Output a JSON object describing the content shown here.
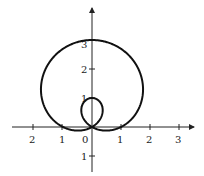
{
  "chart_data": {
    "type": "line",
    "title": "",
    "equation_hint": "polar limacon r = 1 + 2 sin(theta)",
    "xlabel": "",
    "ylabel": "",
    "xlim": [
      -2.8,
      3.4
    ],
    "ylim": [
      -1.6,
      4.2
    ],
    "grid": false,
    "x_ticks": [
      {
        "value": -2,
        "label": "2"
      },
      {
        "value": -1,
        "label": "1"
      },
      {
        "value": 0,
        "label": "0"
      },
      {
        "value": 1,
        "label": "1"
      },
      {
        "value": 2,
        "label": "2"
      },
      {
        "value": 3,
        "label": "3"
      }
    ],
    "y_ticks": [
      {
        "value": 1,
        "label": "1"
      },
      {
        "value": 2,
        "label": "2"
      },
      {
        "value": 3,
        "label": "3"
      },
      {
        "value": -1,
        "label": "1"
      }
    ],
    "series": [
      {
        "name": "limacon",
        "description": "outer loop peaks at (0,3), crosses x-axis at -1 and 1; inner loop reaches (0,1)"
      }
    ]
  },
  "labels": {
    "x": [
      "2",
      "1",
      "0",
      "1",
      "2",
      "3"
    ],
    "y": [
      "3",
      "2",
      "1",
      "1"
    ]
  }
}
